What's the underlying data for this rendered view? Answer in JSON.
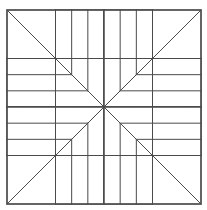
{
  "page": {
    "background_color": "#ffffff",
    "width": 207,
    "height": 210
  },
  "artwork": {
    "name": "blazing-star-quilt-block",
    "alt_names": [
      "Lone Star",
      "Eight-Pointed Star",
      "Star of Bethlehem"
    ],
    "description": "Line-art coloring-page diagram of an eight-pointed star quilt block drawn inside a square frame divided into a four-by-four grid.",
    "style": "uncolored line drawing / coloring page",
    "line_color": "#4a4a4a",
    "fill_color": "#ffffff",
    "line_width": 1,
    "frame": {
      "left": 7,
      "top": 10,
      "right": 201,
      "bottom": 204,
      "width": 194,
      "height": 194
    },
    "grid": {
      "columns": 4,
      "rows": 4,
      "x_lines": [
        7,
        55.5,
        104,
        152.5,
        201
      ],
      "y_lines": [
        10,
        58.5,
        107,
        155.5,
        204
      ]
    },
    "center": {
      "x": 104,
      "y": 107
    },
    "star": {
      "point_count": 8,
      "strips_per_point": 3,
      "point_directions": [
        "north",
        "northeast",
        "east",
        "southeast",
        "south",
        "southwest",
        "west",
        "northwest"
      ]
    },
    "background_shapes": {
      "corner_triangles": 4,
      "edge_squares": 4
    }
  }
}
